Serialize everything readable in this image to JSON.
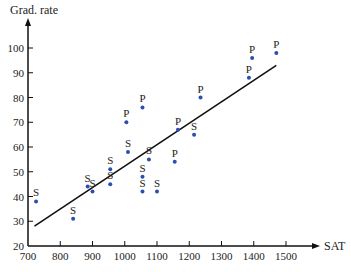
{
  "chart_data": {
    "type": "scatter",
    "title": "",
    "xlabel": "SAT",
    "ylabel": "Grad. rate",
    "xlim": [
      700,
      1550
    ],
    "ylim": [
      20,
      105
    ],
    "xticks": [
      700,
      800,
      900,
      1000,
      1100,
      1200,
      1300,
      1400,
      1500
    ],
    "yticks": [
      20,
      30,
      40,
      50,
      60,
      70,
      80,
      90,
      100
    ],
    "grid": false,
    "legend": "none (points labeled S or P)",
    "point_labels": {
      "S": "S",
      "P": "P"
    },
    "points": [
      {
        "x": 725,
        "y": 38,
        "label": "S"
      },
      {
        "x": 840,
        "y": 31,
        "label": "S"
      },
      {
        "x": 885,
        "y": 44,
        "label": "S"
      },
      {
        "x": 900,
        "y": 42,
        "label": "S"
      },
      {
        "x": 955,
        "y": 51,
        "label": "S"
      },
      {
        "x": 955,
        "y": 45,
        "label": "S"
      },
      {
        "x": 1010,
        "y": 58,
        "label": "S"
      },
      {
        "x": 1005,
        "y": 70,
        "label": "P"
      },
      {
        "x": 1055,
        "y": 76,
        "label": "P"
      },
      {
        "x": 1055,
        "y": 48,
        "label": "S"
      },
      {
        "x": 1055,
        "y": 42,
        "label": "S"
      },
      {
        "x": 1075,
        "y": 55,
        "label": "S"
      },
      {
        "x": 1100,
        "y": 42,
        "label": "S"
      },
      {
        "x": 1155,
        "y": 54,
        "label": "P"
      },
      {
        "x": 1165,
        "y": 67,
        "label": "P"
      },
      {
        "x": 1215,
        "y": 65,
        "label": "S"
      },
      {
        "x": 1235,
        "y": 80,
        "label": "P"
      },
      {
        "x": 1385,
        "y": 88,
        "label": "P"
      },
      {
        "x": 1395,
        "y": 96,
        "label": "P"
      },
      {
        "x": 1470,
        "y": 98,
        "label": "P"
      }
    ],
    "regression_line": {
      "x": [
        720,
        1470
      ],
      "y": [
        28,
        93
      ]
    },
    "colors": {
      "points": "#2a4fb0",
      "line": "#111111",
      "axes": "#111111"
    }
  }
}
